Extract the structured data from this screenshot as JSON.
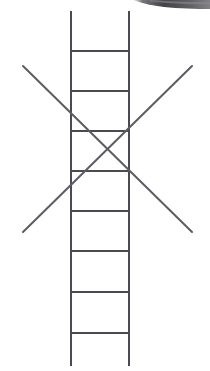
{
  "canvas": {
    "width": 210,
    "height": 371,
    "background_color": "#ffffff",
    "title": "Ladder figure crossed out with an X"
  },
  "style": {
    "stroke_color": "#4a4a52",
    "stroke_color_light": "#5c5c64",
    "stroke_width": 2.0,
    "artifact_color": "#5b5b5f",
    "artifact_color_dark": "#3a3a3e"
  },
  "figure": {
    "name": "ladder",
    "rails": [
      {
        "name": "left-rail",
        "x1": 71,
        "y1": 11,
        "x2": 71,
        "y2": 366
      },
      {
        "name": "right-rail",
        "x1": 129,
        "y1": 11,
        "x2": 129,
        "y2": 366
      }
    ],
    "rungs": [
      {
        "name": "rung-1",
        "x1": 71,
        "y1": 51,
        "x2": 129,
        "y2": 51
      },
      {
        "name": "rung-2",
        "x1": 71,
        "y1": 91,
        "x2": 129,
        "y2": 91
      },
      {
        "name": "rung-3",
        "x1": 71,
        "y1": 131,
        "x2": 129,
        "y2": 131
      },
      {
        "name": "rung-4",
        "x1": 71,
        "y1": 171,
        "x2": 129,
        "y2": 171
      },
      {
        "name": "rung-5",
        "x1": 71,
        "y1": 211,
        "x2": 129,
        "y2": 211
      },
      {
        "name": "rung-6",
        "x1": 71,
        "y1": 251,
        "x2": 129,
        "y2": 251
      },
      {
        "name": "rung-7",
        "x1": 71,
        "y1": 292,
        "x2": 129,
        "y2": 292
      },
      {
        "name": "rung-8",
        "x1": 71,
        "y1": 333,
        "x2": 129,
        "y2": 333
      }
    ],
    "rung_count": 8,
    "cross_out": {
      "name": "x-mark",
      "center": {
        "x": 107,
        "y": 149
      },
      "strokes": [
        {
          "name": "x-stroke-descending",
          "x1": 23,
          "y1": 66,
          "x2": 192,
          "y2": 232
        },
        {
          "name": "x-stroke-ascending",
          "x1": 23,
          "y1": 232,
          "x2": 192,
          "y2": 66
        }
      ]
    }
  },
  "artifacts": [
    {
      "name": "scan-smudge-top-right",
      "description": "Dark grey scanning smudge along the top-right edge",
      "x": 133,
      "y": 0,
      "width": 77,
      "height": 10
    }
  ]
}
